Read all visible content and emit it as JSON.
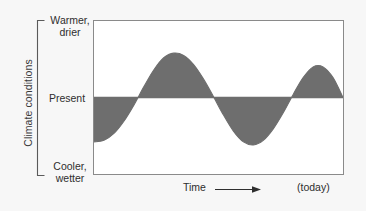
{
  "figure": {
    "name": "climate-conditions-over-time-schematic",
    "background_color": "#f7f7f7",
    "plot_background_color": "#ffffff",
    "frame_color": "#8a8a8a"
  },
  "axes": {
    "y_title": "Climate conditions",
    "y_labels": {
      "top": "Warmer,\ndrier",
      "middle": "Present",
      "bottom": "Cooler,\nwetter"
    },
    "x_title": "Time",
    "x_end_label": "(today)",
    "arrow_icon": "right-arrow-icon",
    "bracket_icon": "y-axis-bracket-icon"
  },
  "chart_data": {
    "type": "area",
    "title": "",
    "xlabel": "Time",
    "ylabel": "Climate conditions",
    "grid": false,
    "legend": null,
    "baseline_label": "Present",
    "ylim": [
      -1,
      1
    ],
    "ytick_labels": [
      "Cooler, wetter",
      "Present",
      "Warmer, drier"
    ],
    "ytick_values": [
      -1,
      0,
      1
    ],
    "xlim": [
      0,
      100
    ],
    "xtick_labels": [
      "",
      "(today)"
    ],
    "fill_color": "#6e6e6e",
    "line_color": "#6e6e6e",
    "baseline_color": "#6e6e6e",
    "series": [
      {
        "name": "climate conditions",
        "x": [
          0,
          4,
          8,
          12,
          16,
          20,
          24,
          28,
          32,
          36,
          40,
          44,
          48,
          52,
          56,
          60,
          64,
          68,
          72,
          76,
          80,
          84,
          88,
          92,
          96,
          100
        ],
        "y": [
          -0.58,
          -0.56,
          -0.47,
          -0.31,
          -0.1,
          0.14,
          0.36,
          0.52,
          0.58,
          0.55,
          0.43,
          0.24,
          0.01,
          -0.23,
          -0.44,
          -0.58,
          -0.62,
          -0.56,
          -0.41,
          -0.2,
          0.04,
          0.26,
          0.4,
          0.4,
          0.26,
          0.0
        ]
      }
    ],
    "annotations": [
      {
        "text": "Warmer, drier",
        "position": "y-axis-top"
      },
      {
        "text": "Present",
        "position": "y-axis-middle"
      },
      {
        "text": "Cooler, wetter",
        "position": "y-axis-bottom"
      },
      {
        "text": "Time",
        "position": "below-axis-center"
      },
      {
        "text": "(today)",
        "position": "below-axis-right"
      }
    ]
  }
}
